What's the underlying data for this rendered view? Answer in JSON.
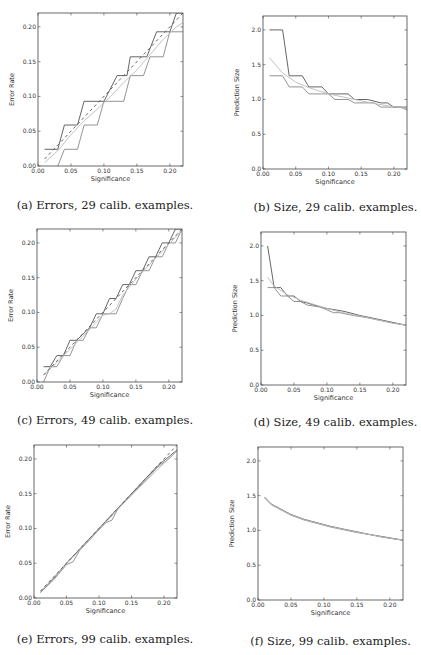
{
  "figure": {
    "panels": [
      {
        "id": "a",
        "caption": "(a) Errors, 29 calib. examples."
      },
      {
        "id": "b",
        "caption": "(b) Size, 29 calib. examples."
      },
      {
        "id": "c",
        "caption": "(c) Errors, 49 calib. examples."
      },
      {
        "id": "d",
        "caption": "(d) Size, 49 calib. examples."
      },
      {
        "id": "e",
        "caption": "(e) Errors, 99 calib. examples."
      },
      {
        "id": "f",
        "caption": "(f) Size, 99 calib. examples."
      }
    ]
  },
  "colors": {
    "dark": "#555555",
    "mid": "#888888",
    "light": "#bbbbbb",
    "dashed": "#666666",
    "axis": "#444444"
  },
  "chart_data": [
    {
      "id": "a",
      "type": "line",
      "title": "(a) Errors, 29 calib. examples.",
      "xlabel": "Significance",
      "ylabel": "Error Rate",
      "xlim": [
        0.0,
        0.22
      ],
      "ylim": [
        0.0,
        0.22
      ],
      "xticks": [
        0.0,
        0.05,
        0.1,
        0.15,
        0.2
      ],
      "xticklabels": [
        "0.00",
        "0.05",
        "0.10",
        "0.15",
        "0.20"
      ],
      "yticks": [
        0.0,
        0.05,
        0.1,
        0.15,
        0.2
      ],
      "yticklabels": [
        "0.00",
        "0.05",
        "0.10",
        "0.15",
        "0.20"
      ],
      "grid": false,
      "series": [
        {
          "name": "upper",
          "color": "dark",
          "dash": false,
          "x": [
            0.01,
            0.03,
            0.04,
            0.06,
            0.07,
            0.1,
            0.12,
            0.135,
            0.14,
            0.165,
            0.18,
            0.2,
            0.21,
            0.22
          ],
          "y": [
            0.024,
            0.024,
            0.059,
            0.059,
            0.093,
            0.093,
            0.13,
            0.13,
            0.157,
            0.157,
            0.193,
            0.193,
            0.22,
            0.22
          ]
        },
        {
          "name": "lower",
          "color": "mid",
          "dash": false,
          "x": [
            0.03,
            0.04,
            0.06,
            0.07,
            0.09,
            0.1,
            0.13,
            0.14,
            0.16,
            0.17,
            0.19,
            0.2,
            0.22
          ],
          "y": [
            0.0,
            0.024,
            0.024,
            0.059,
            0.059,
            0.093,
            0.093,
            0.13,
            0.13,
            0.157,
            0.157,
            0.193,
            0.193
          ]
        },
        {
          "name": "smooth",
          "color": "light",
          "dash": false,
          "x": [
            0.01,
            0.03,
            0.05,
            0.07,
            0.09,
            0.11,
            0.13,
            0.15,
            0.17,
            0.19,
            0.21,
            0.22
          ],
          "y": [
            0.005,
            0.022,
            0.045,
            0.065,
            0.082,
            0.1,
            0.12,
            0.138,
            0.16,
            0.182,
            0.2,
            0.206
          ]
        },
        {
          "name": "expected",
          "color": "dashed",
          "dash": true,
          "x": [
            0.01,
            0.22
          ],
          "y": [
            0.01,
            0.22
          ]
        }
      ]
    },
    {
      "id": "b",
      "type": "line",
      "title": "(b) Size, 29 calib. examples.",
      "xlabel": "Significance",
      "ylabel": "Prediction Size",
      "xlim": [
        0.0,
        0.22
      ],
      "ylim": [
        0.0,
        2.2
      ],
      "xticks": [
        0.0,
        0.05,
        0.1,
        0.15,
        0.2
      ],
      "xticklabels": [
        "0.00",
        "0.05",
        "0.10",
        "0.15",
        "0.20"
      ],
      "yticks": [
        0.0,
        0.5,
        1.0,
        1.5,
        2.0
      ],
      "yticklabels": [
        "0.0",
        "0.5",
        "1.0",
        "1.5",
        "2.0"
      ],
      "grid": false,
      "series": [
        {
          "name": "upper",
          "color": "dark",
          "dash": false,
          "x": [
            0.01,
            0.03,
            0.04,
            0.06,
            0.07,
            0.09,
            0.1,
            0.13,
            0.14,
            0.16,
            0.18,
            0.19,
            0.2,
            0.22
          ],
          "y": [
            2.0,
            2.0,
            1.34,
            1.34,
            1.18,
            1.18,
            1.08,
            1.08,
            1.0,
            1.0,
            0.95,
            0.95,
            0.89,
            0.89
          ]
        },
        {
          "name": "lower",
          "color": "mid",
          "dash": false,
          "x": [
            0.01,
            0.03,
            0.04,
            0.06,
            0.07,
            0.1,
            0.11,
            0.13,
            0.14,
            0.17,
            0.18,
            0.21,
            0.22
          ],
          "y": [
            1.34,
            1.34,
            1.18,
            1.18,
            1.08,
            1.08,
            1.0,
            1.0,
            0.95,
            0.95,
            0.89,
            0.89,
            0.85
          ]
        },
        {
          "name": "smooth",
          "color": "light",
          "dash": false,
          "x": [
            0.01,
            0.03,
            0.05,
            0.07,
            0.09,
            0.11,
            0.13,
            0.15,
            0.17,
            0.19,
            0.22
          ],
          "y": [
            1.6,
            1.38,
            1.25,
            1.17,
            1.11,
            1.06,
            1.02,
            0.98,
            0.94,
            0.91,
            0.87
          ]
        }
      ]
    },
    {
      "id": "c",
      "type": "line",
      "title": "(c) Errors, 49 calib. examples.",
      "xlabel": "Significance",
      "ylabel": "Error Rate",
      "xlim": [
        0.0,
        0.22
      ],
      "ylim": [
        0.0,
        0.22
      ],
      "xticks": [
        0.0,
        0.05,
        0.1,
        0.15,
        0.2
      ],
      "xticklabels": [
        "0.00",
        "0.05",
        "0.10",
        "0.15",
        "0.20"
      ],
      "yticks": [
        0.0,
        0.05,
        0.1,
        0.15,
        0.2
      ],
      "yticklabels": [
        "0.00",
        "0.05",
        "0.10",
        "0.15",
        "0.20"
      ],
      "grid": false,
      "series": [
        {
          "name": "upper",
          "color": "dark",
          "dash": false,
          "x": [
            0.01,
            0.02,
            0.03,
            0.04,
            0.05,
            0.06,
            0.08,
            0.09,
            0.1,
            0.11,
            0.12,
            0.13,
            0.14,
            0.15,
            0.16,
            0.17,
            0.18,
            0.19,
            0.2,
            0.21,
            0.22
          ],
          "y": [
            0.022,
            0.022,
            0.038,
            0.038,
            0.06,
            0.06,
            0.078,
            0.098,
            0.098,
            0.12,
            0.12,
            0.14,
            0.14,
            0.16,
            0.16,
            0.18,
            0.18,
            0.2,
            0.2,
            0.22,
            0.22
          ]
        },
        {
          "name": "lower",
          "color": "mid",
          "dash": false,
          "x": [
            0.01,
            0.02,
            0.03,
            0.04,
            0.05,
            0.06,
            0.07,
            0.08,
            0.09,
            0.1,
            0.12,
            0.13,
            0.14,
            0.15,
            0.16,
            0.17,
            0.18,
            0.19,
            0.2,
            0.21,
            0.22
          ],
          "y": [
            0.0,
            0.022,
            0.022,
            0.038,
            0.038,
            0.06,
            0.06,
            0.078,
            0.078,
            0.098,
            0.098,
            0.12,
            0.14,
            0.14,
            0.16,
            0.16,
            0.18,
            0.18,
            0.2,
            0.2,
            0.22
          ]
        },
        {
          "name": "smooth",
          "color": "light",
          "dash": false,
          "x": [
            0.01,
            0.03,
            0.05,
            0.07,
            0.09,
            0.1,
            0.11,
            0.12,
            0.13,
            0.15,
            0.17,
            0.19,
            0.21,
            0.22
          ],
          "y": [
            0.01,
            0.028,
            0.047,
            0.066,
            0.086,
            0.096,
            0.098,
            0.105,
            0.125,
            0.148,
            0.168,
            0.188,
            0.208,
            0.218
          ]
        },
        {
          "name": "expected",
          "color": "dashed",
          "dash": true,
          "x": [
            0.01,
            0.22
          ],
          "y": [
            0.01,
            0.22
          ]
        }
      ]
    },
    {
      "id": "d",
      "type": "line",
      "title": "(d) Size, 49 calib. examples.",
      "xlabel": "Significance",
      "ylabel": "Prediction Size",
      "xlim": [
        0.0,
        0.22
      ],
      "ylim": [
        0.0,
        2.2
      ],
      "xticks": [
        0.0,
        0.05,
        0.1,
        0.15,
        0.2
      ],
      "xticklabels": [
        "0.00",
        "0.05",
        "0.10",
        "0.15",
        "0.20"
      ],
      "yticks": [
        0.0,
        0.5,
        1.0,
        1.5,
        2.0
      ],
      "yticklabels": [
        "0.0",
        "0.5",
        "1.0",
        "1.5",
        "2.0"
      ],
      "grid": false,
      "series": [
        {
          "name": "upper",
          "color": "dark",
          "dash": false,
          "x": [
            0.01,
            0.02,
            0.03,
            0.04,
            0.05,
            0.06,
            0.07,
            0.08,
            0.1,
            0.12,
            0.13,
            0.15,
            0.17,
            0.19,
            0.22
          ],
          "y": [
            2.0,
            1.4,
            1.4,
            1.28,
            1.28,
            1.2,
            1.18,
            1.15,
            1.1,
            1.07,
            1.05,
            1.0,
            0.96,
            0.92,
            0.86
          ]
        },
        {
          "name": "lower",
          "color": "mid",
          "dash": false,
          "x": [
            0.01,
            0.02,
            0.03,
            0.04,
            0.05,
            0.06,
            0.07,
            0.09,
            0.11,
            0.12,
            0.14,
            0.16,
            0.18,
            0.2,
            0.22
          ],
          "y": [
            1.4,
            1.4,
            1.28,
            1.28,
            1.2,
            1.2,
            1.15,
            1.12,
            1.04,
            1.04,
            1.0,
            0.97,
            0.93,
            0.89,
            0.86
          ]
        },
        {
          "name": "smooth",
          "color": "light",
          "dash": false,
          "x": [
            0.01,
            0.02,
            0.04,
            0.06,
            0.08,
            0.1,
            0.12,
            0.14,
            0.16,
            0.18,
            0.2,
            0.22
          ],
          "y": [
            1.55,
            1.42,
            1.3,
            1.22,
            1.16,
            1.1,
            1.05,
            1.01,
            0.97,
            0.93,
            0.89,
            0.86
          ]
        }
      ]
    },
    {
      "id": "e",
      "type": "line",
      "title": "(e) Errors, 99 calib. examples.",
      "xlabel": "Significance",
      "ylabel": "Error Rate",
      "xlim": [
        0.0,
        0.22
      ],
      "ylim": [
        0.0,
        0.22
      ],
      "xticks": [
        0.0,
        0.05,
        0.1,
        0.15,
        0.2
      ],
      "xticklabels": [
        "0.00",
        "0.05",
        "0.10",
        "0.15",
        "0.20"
      ],
      "yticks": [
        0.0,
        0.05,
        0.1,
        0.15,
        0.2
      ],
      "yticklabels": [
        "0.00",
        "0.05",
        "0.10",
        "0.15",
        "0.20"
      ],
      "grid": false,
      "series": [
        {
          "name": "upper",
          "color": "dark",
          "dash": false,
          "x": [
            0.01,
            0.03,
            0.05,
            0.07,
            0.09,
            0.11,
            0.13,
            0.15,
            0.17,
            0.19,
            0.21,
            0.22
          ],
          "y": [
            0.008,
            0.028,
            0.05,
            0.07,
            0.09,
            0.11,
            0.13,
            0.15,
            0.17,
            0.19,
            0.205,
            0.213
          ]
        },
        {
          "name": "lower",
          "color": "mid",
          "dash": false,
          "x": [
            0.01,
            0.03,
            0.05,
            0.06,
            0.07,
            0.09,
            0.11,
            0.12,
            0.13,
            0.15,
            0.17,
            0.19,
            0.21,
            0.22
          ],
          "y": [
            0.008,
            0.026,
            0.048,
            0.052,
            0.068,
            0.088,
            0.108,
            0.112,
            0.13,
            0.148,
            0.168,
            0.188,
            0.202,
            0.212
          ]
        },
        {
          "name": "smooth",
          "color": "light",
          "dash": false,
          "x": [
            0.01,
            0.05,
            0.1,
            0.15,
            0.22
          ],
          "y": [
            0.009,
            0.049,
            0.098,
            0.148,
            0.212
          ]
        },
        {
          "name": "expected",
          "color": "dashed",
          "dash": true,
          "x": [
            0.01,
            0.22
          ],
          "y": [
            0.01,
            0.22
          ]
        }
      ]
    },
    {
      "id": "f",
      "type": "line",
      "title": "(f) Size, 99 calib. examples.",
      "xlabel": "Significance",
      "ylabel": "Prediction Size",
      "xlim": [
        0.0,
        0.22
      ],
      "ylim": [
        0.0,
        2.2
      ],
      "xticks": [
        0.0,
        0.05,
        0.1,
        0.15,
        0.2
      ],
      "xticklabels": [
        "0.00",
        "0.05",
        "0.10",
        "0.15",
        "0.20"
      ],
      "yticks": [
        0.0,
        0.5,
        1.0,
        1.5,
        2.0
      ],
      "yticklabels": [
        "0.0",
        "0.5",
        "1.0",
        "1.5",
        "2.0"
      ],
      "grid": false,
      "series": [
        {
          "name": "upper",
          "color": "dark",
          "dash": false,
          "x": [
            0.01,
            0.02,
            0.03,
            0.05,
            0.07,
            0.09,
            0.11,
            0.13,
            0.15,
            0.17,
            0.19,
            0.22
          ],
          "y": [
            1.48,
            1.38,
            1.33,
            1.23,
            1.16,
            1.11,
            1.06,
            1.02,
            0.98,
            0.94,
            0.91,
            0.86
          ]
        },
        {
          "name": "lower",
          "color": "mid",
          "dash": false,
          "x": [
            0.01,
            0.02,
            0.03,
            0.05,
            0.07,
            0.09,
            0.11,
            0.13,
            0.15,
            0.17,
            0.19,
            0.22
          ],
          "y": [
            1.47,
            1.37,
            1.32,
            1.22,
            1.15,
            1.1,
            1.05,
            1.01,
            0.97,
            0.94,
            0.9,
            0.86
          ]
        },
        {
          "name": "smooth",
          "color": "light",
          "dash": false,
          "x": [
            0.01,
            0.02,
            0.03,
            0.05,
            0.07,
            0.09,
            0.11,
            0.13,
            0.15,
            0.17,
            0.19,
            0.22
          ],
          "y": [
            1.475,
            1.375,
            1.325,
            1.225,
            1.155,
            1.105,
            1.055,
            1.015,
            0.975,
            0.94,
            0.905,
            0.86
          ]
        }
      ]
    }
  ]
}
